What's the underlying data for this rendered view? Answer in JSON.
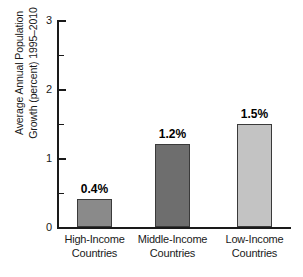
{
  "chart_data": {
    "type": "bar",
    "title": "",
    "xlabel": "",
    "ylabel_line1": "Average Annual Population",
    "ylabel_line2": "Growth (percent) 1995–2010",
    "categories": [
      "High-Income Countries",
      "Middle-Income Countries",
      "Low-Income Countries"
    ],
    "category_lines": [
      [
        "High-Income",
        "Countries"
      ],
      [
        "Middle-Income",
        "Countries"
      ],
      [
        "Low-Income",
        "Countries"
      ]
    ],
    "values": [
      0.4,
      1.2,
      1.5
    ],
    "value_labels": [
      "0.4%",
      "1.2%",
      "1.5%"
    ],
    "bar_colors": [
      "#8a8a8a",
      "#6e6e6e",
      "#c3c3c3"
    ],
    "ylim": [
      0,
      3
    ],
    "ytick_labels": [
      "0",
      "1",
      "2",
      "3"
    ],
    "ytick_values": [
      0,
      1,
      2,
      3
    ],
    "yminor_values": [
      0.5,
      1.5,
      2.5
    ],
    "grid": false,
    "legend": "none"
  }
}
